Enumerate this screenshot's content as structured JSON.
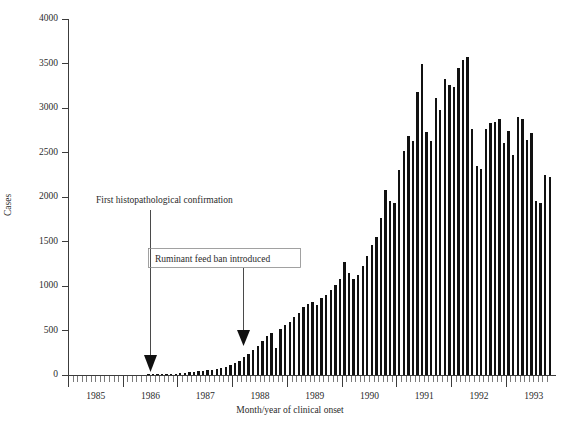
{
  "chart_data": {
    "type": "bar",
    "title": "",
    "xlabel": "Month/year of clinical onset",
    "ylabel": "Cases",
    "ylim": [
      0,
      4000
    ],
    "ytick_values": [
      0,
      500,
      1000,
      1500,
      2000,
      2500,
      3000,
      3500,
      4000
    ],
    "ytick_labels": [
      "0",
      "500",
      "1000",
      "1500",
      "2000",
      "2500",
      "3000",
      "3500",
      "4000"
    ],
    "xtick_labels": [
      "1985",
      "1986",
      "1987",
      "1988",
      "1989",
      "1990",
      "1991",
      "1992",
      "1993"
    ],
    "x_start_year": 1985,
    "x_start_month": 1,
    "grid": false,
    "legend": null,
    "bar_color": "#111111",
    "categories": [
      "1985-01",
      "1985-02",
      "1985-03",
      "1985-04",
      "1985-05",
      "1985-06",
      "1985-07",
      "1985-08",
      "1985-09",
      "1985-10",
      "1985-11",
      "1985-12",
      "1986-01",
      "1986-02",
      "1986-03",
      "1986-04",
      "1986-05",
      "1986-06",
      "1986-07",
      "1986-08",
      "1986-09",
      "1986-10",
      "1986-11",
      "1986-12",
      "1987-01",
      "1987-02",
      "1987-03",
      "1987-04",
      "1987-05",
      "1987-06",
      "1987-07",
      "1987-08",
      "1987-09",
      "1987-10",
      "1987-11",
      "1987-12",
      "1988-01",
      "1988-02",
      "1988-03",
      "1988-04",
      "1988-05",
      "1988-06",
      "1988-07",
      "1988-08",
      "1988-09",
      "1988-10",
      "1988-11",
      "1988-12",
      "1989-01",
      "1989-02",
      "1989-03",
      "1989-04",
      "1989-05",
      "1989-06",
      "1989-07",
      "1989-08",
      "1989-09",
      "1989-10",
      "1989-11",
      "1989-12",
      "1990-01",
      "1990-02",
      "1990-03",
      "1990-04",
      "1990-05",
      "1990-06",
      "1990-07",
      "1990-08",
      "1990-09",
      "1990-10",
      "1990-11",
      "1990-12",
      "1991-01",
      "1991-02",
      "1991-03",
      "1991-04",
      "1991-05",
      "1991-06",
      "1991-07",
      "1991-08",
      "1991-09",
      "1991-10",
      "1991-11",
      "1991-12",
      "1992-01",
      "1992-02",
      "1992-03",
      "1992-04",
      "1992-05",
      "1992-06",
      "1992-07",
      "1992-08",
      "1992-09",
      "1992-10",
      "1992-11",
      "1992-12",
      "1993-01",
      "1993-02",
      "1993-03",
      "1993-04",
      "1993-05",
      "1993-06",
      "1993-07",
      "1993-08",
      "1993-09",
      "1993-10"
    ],
    "values": [
      0,
      0,
      0,
      0,
      0,
      0,
      0,
      0,
      0,
      0,
      0,
      0,
      0,
      0,
      0,
      0,
      0,
      6,
      8,
      10,
      9,
      12,
      14,
      16,
      20,
      26,
      30,
      34,
      40,
      46,
      52,
      60,
      70,
      80,
      95,
      110,
      130,
      160,
      200,
      240,
      280,
      330,
      380,
      440,
      470,
      300,
      520,
      560,
      600,
      650,
      700,
      760,
      800,
      820,
      790,
      860,
      900,
      950,
      1010,
      1080,
      1270,
      1150,
      1080,
      1120,
      1220,
      1340,
      1460,
      1550,
      1760,
      2080,
      1960,
      1930,
      2300,
      2520,
      2680,
      2630,
      3180,
      3490,
      2730,
      2630,
      3110,
      2980,
      3330,
      3260,
      3240,
      3450,
      3540,
      3570,
      2760,
      2350,
      2320,
      2760,
      2830,
      2840,
      2880,
      2610,
      2740,
      2470,
      2900,
      2880,
      2640,
      2720,
      1960,
      1930,
      2250,
      2230
    ],
    "annotations": [
      {
        "id": "first-confirmation",
        "text": "First histopathological confirmation",
        "boxed": false,
        "target": "1986-07"
      },
      {
        "id": "feed-ban",
        "text": "Ruminant feed ban introduced",
        "boxed": true,
        "target": "1988-07"
      }
    ]
  }
}
